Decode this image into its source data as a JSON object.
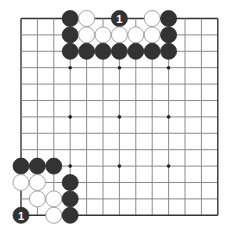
{
  "board": {
    "size": 13,
    "origin_x": 21,
    "origin_y": 18.5,
    "spacing_x": 16.4,
    "spacing_y": 16.4,
    "stone_radius": 8,
    "colors": {
      "background": "#ffffff",
      "grid": "#8a8a8a",
      "edge": "#333333",
      "black_stone": "#333333",
      "white_stone": "#ffffff",
      "white_stroke": "#9a9a9a",
      "label": "#ffffff"
    },
    "star_points": [
      [
        3,
        3
      ],
      [
        6,
        3
      ],
      [
        9,
        3
      ],
      [
        3,
        6
      ],
      [
        6,
        6
      ],
      [
        9,
        6
      ],
      [
        3,
        9
      ],
      [
        6,
        9
      ],
      [
        9,
        9
      ]
    ],
    "stones": [
      {
        "color": "black",
        "col": 3,
        "row": 0
      },
      {
        "color": "white",
        "col": 4,
        "row": 0
      },
      {
        "color": "black",
        "col": 6,
        "row": 0,
        "label": "1"
      },
      {
        "color": "white",
        "col": 8,
        "row": 0
      },
      {
        "color": "black",
        "col": 9,
        "row": 0
      },
      {
        "color": "black",
        "col": 3,
        "row": 1
      },
      {
        "color": "white",
        "col": 4,
        "row": 1
      },
      {
        "color": "white",
        "col": 5,
        "row": 1
      },
      {
        "color": "white",
        "col": 6,
        "row": 1
      },
      {
        "color": "white",
        "col": 7,
        "row": 1
      },
      {
        "color": "white",
        "col": 8,
        "row": 1
      },
      {
        "color": "black",
        "col": 9,
        "row": 1
      },
      {
        "color": "black",
        "col": 3,
        "row": 2
      },
      {
        "color": "black",
        "col": 4,
        "row": 2
      },
      {
        "color": "black",
        "col": 5,
        "row": 2
      },
      {
        "color": "black",
        "col": 6,
        "row": 2
      },
      {
        "color": "black",
        "col": 7,
        "row": 2
      },
      {
        "color": "black",
        "col": 8,
        "row": 2
      },
      {
        "color": "black",
        "col": 9,
        "row": 2
      },
      {
        "color": "black",
        "col": 0,
        "row": 9
      },
      {
        "color": "black",
        "col": 1,
        "row": 9
      },
      {
        "color": "black",
        "col": 2,
        "row": 9
      },
      {
        "color": "white",
        "col": 0,
        "row": 10
      },
      {
        "color": "white",
        "col": 1,
        "row": 10
      },
      {
        "color": "black",
        "col": 3,
        "row": 10
      },
      {
        "color": "white",
        "col": 1,
        "row": 11
      },
      {
        "color": "white",
        "col": 2,
        "row": 11
      },
      {
        "color": "black",
        "col": 3,
        "row": 11
      },
      {
        "color": "black",
        "col": 0,
        "row": 12,
        "label": "1"
      },
      {
        "color": "white",
        "col": 2,
        "row": 12
      },
      {
        "color": "black",
        "col": 3,
        "row": 12
      }
    ]
  }
}
